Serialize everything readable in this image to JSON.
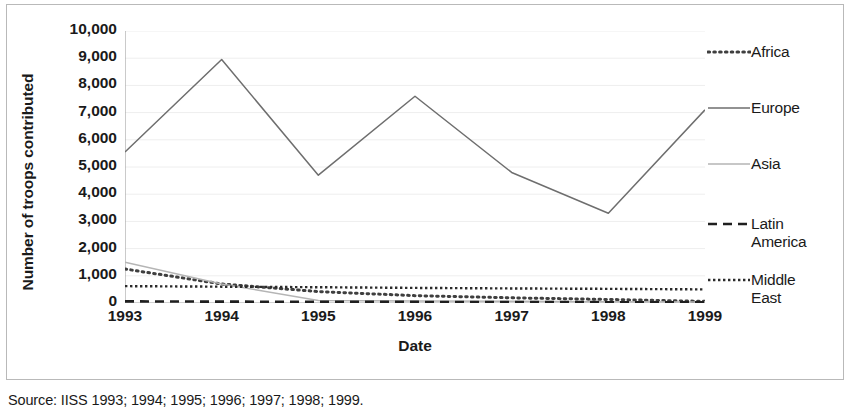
{
  "chart_data": {
    "type": "line",
    "title": "",
    "xlabel": "Date",
    "ylabel": "Number of troops contributed",
    "x": [
      "1993",
      "1994",
      "1995",
      "1996",
      "1997",
      "1998",
      "1999"
    ],
    "xlim": [
      1993,
      1999
    ],
    "ylim": [
      0,
      10000
    ],
    "ytick_labels": [
      "10,000",
      "9,000",
      "8,000",
      "7,000",
      "6,000",
      "5,000",
      "4,000",
      "3,000",
      "2,000",
      "1,000",
      "0"
    ],
    "ytick_values": [
      10000,
      9000,
      8000,
      7000,
      6000,
      5000,
      4000,
      3000,
      2000,
      1000,
      0
    ],
    "grid": true,
    "legend_position": "right",
    "series": [
      {
        "name": "Africa",
        "style": "dotted",
        "color": "#3f3f3f",
        "values": [
          1250,
          700,
          420,
          270,
          190,
          130,
          60
        ]
      },
      {
        "name": "Europe",
        "style": "solid",
        "color": "#6e6e6e",
        "values": [
          5550,
          8950,
          4700,
          7600,
          4800,
          3300,
          7100
        ]
      },
      {
        "name": "Asia",
        "style": "solid",
        "color": "#b5b5b5",
        "values": [
          1500,
          700,
          90,
          70,
          60,
          50,
          40
        ]
      },
      {
        "name": "Latin America",
        "style": "dashed",
        "color": "#1f1f1f",
        "values": [
          60,
          50,
          45,
          40,
          35,
          30,
          30
        ]
      },
      {
        "name": "Middle East",
        "style": "fine-dotted",
        "color": "#2b2b2b",
        "values": [
          620,
          600,
          580,
          555,
          535,
          520,
          500
        ]
      }
    ]
  },
  "legend": {
    "entries": [
      {
        "label": "Africa",
        "swatch": "dotted-line-swatch"
      },
      {
        "label": "Europe",
        "swatch": "solid-dark-line-swatch"
      },
      {
        "label": "Asia",
        "swatch": "solid-light-line-swatch"
      },
      {
        "label": "Latin\nAmerica",
        "swatch": "dashed-line-swatch"
      },
      {
        "label": "Middle\nEast",
        "swatch": "fine-dotted-line-swatch"
      }
    ]
  },
  "source": {
    "text": "Source: IISS 1993; 1994; 1995; 1996; 1997; 1998; 1999."
  },
  "colors": {
    "frame": "#b9b9b9",
    "grid": "#eeeeee",
    "axis": "#a6a6a6",
    "text": "#1a1a1a"
  }
}
